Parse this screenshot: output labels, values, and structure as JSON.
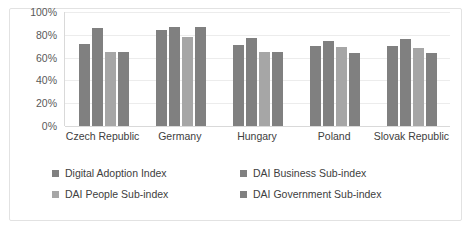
{
  "chart_data": {
    "type": "bar",
    "title": "",
    "subtitle": "",
    "xlabel": "",
    "ylabel": "",
    "ylim": [
      0,
      100
    ],
    "ytick_labels": [
      "100%",
      "80%",
      "60%",
      "40%",
      "20%",
      "0%"
    ],
    "ytick_values": [
      100,
      80,
      60,
      40,
      20,
      0
    ],
    "grid": "horizontal",
    "legend_position": "bottom",
    "value_format": "percent",
    "categories": [
      "Czech Republic",
      "Germany",
      "Hungary",
      "Poland",
      "Slovak Republic"
    ],
    "series": [
      {
        "name": "Digital Adoption Index",
        "color": "#808080",
        "values": [
          72,
          84,
          71,
          70,
          70
        ]
      },
      {
        "name": "DAI Business Sub-index",
        "color": "#808080",
        "values": [
          86,
          87,
          77,
          75,
          76
        ]
      },
      {
        "name": "DAI People Sub-index",
        "color": "#a6a6a6",
        "values": [
          65,
          78,
          65,
          69,
          68
        ]
      },
      {
        "name": "DAI Government Sub-index",
        "color": "#808080",
        "values": [
          65,
          87,
          65,
          64,
          64
        ]
      }
    ]
  },
  "legend": {
    "items": [
      {
        "label": "Digital Adoption Index",
        "color": "#808080"
      },
      {
        "label": "DAI Business Sub-index",
        "color": "#808080"
      },
      {
        "label": "DAI People Sub-index",
        "color": "#a6a6a6"
      },
      {
        "label": "DAI Government Sub-index",
        "color": "#808080"
      }
    ]
  },
  "colors": {
    "bar_dark": "#808080",
    "bar_light": "#a6a6a6",
    "gridline": "#ececec",
    "axis": "#d9d9d9",
    "text": "#404040",
    "tick_text": "#595959",
    "frame": "#e2e2e2",
    "background": "#ffffff"
  }
}
